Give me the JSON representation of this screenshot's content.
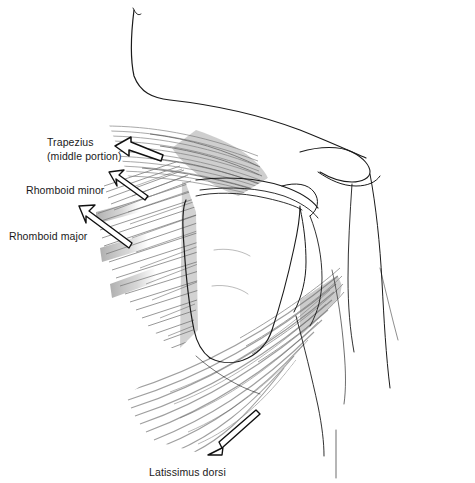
{
  "figure": {
    "background_color": "#ffffff",
    "ink_color": "#1a1a1a",
    "muscle_shade_color": "#8c8c8c",
    "width": 475,
    "height": 483
  },
  "labels": {
    "trapezius": {
      "line1": "Trapezius",
      "line2": "(middle portion)",
      "x": 47,
      "y": 146
    },
    "rhomboid_minor": {
      "text": "Rhomboid minor",
      "x": 26,
      "y": 194
    },
    "rhomboid_major": {
      "text": "Rhomboid major",
      "x": 9,
      "y": 240
    },
    "latissimus_dorsi": {
      "text": "Latissimus dorsi",
      "x": 149,
      "y": 476
    }
  },
  "arrows": {
    "trapezius_arrow": {
      "points_to": "trapezius-muscle",
      "direction": "up-left",
      "style": "hollow-outline-wide"
    },
    "rhomboid_minor_arrow": {
      "points_to": "rhomboid-minor-muscle",
      "direction": "up-left",
      "style": "hollow-outline-thin"
    },
    "rhomboid_major_arrow": {
      "points_to": "rhomboid-major-muscle",
      "direction": "up-left",
      "style": "hollow-outline-thin"
    },
    "latissimus_dorsi_arrow": {
      "points_to": "latissimus-dorsi-muscle",
      "direction": "down-left",
      "style": "hollow-outline-thin"
    }
  },
  "anatomy": {
    "regions": [
      {
        "name": "neck-contour",
        "description": "Neck and upper shoulder outline curving from top to right"
      },
      {
        "name": "trapezius-muscle",
        "description": "Middle trapezius fibers running horizontally toward the scapular spine"
      },
      {
        "name": "rhomboid-minor-muscle",
        "description": "Short diagonal fibers above rhomboid major"
      },
      {
        "name": "rhomboid-major-muscle",
        "description": "Long diagonal fibers from vertebral border of scapula to spine"
      },
      {
        "name": "scapula",
        "description": "Scapular body, spine of scapula and acromion process"
      },
      {
        "name": "humerus-arm",
        "description": "Upper arm contour descending on the right"
      },
      {
        "name": "latissimus-dorsi-muscle",
        "description": "Broad fan of fibers sweeping from lower back to the humerus"
      },
      {
        "name": "torso-contour",
        "description": "Lateral trunk and flank outlines"
      }
    ]
  }
}
